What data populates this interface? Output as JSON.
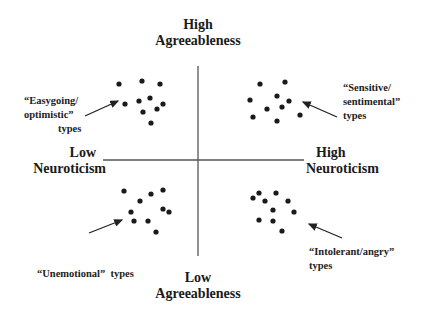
{
  "axes": {
    "top": [
      "High",
      "Agreeableness"
    ],
    "bottom": [
      "Low",
      "Agreeableness"
    ],
    "left": [
      "Low",
      "Neuroticism"
    ],
    "right": [
      "High",
      "Neuroticism"
    ]
  },
  "quadrants": {
    "upper_left": [
      "“Easygoing/",
      "optimistic”",
      "types"
    ],
    "upper_right": [
      "“Sensitive/",
      "sentimental”",
      "types"
    ],
    "lower_left": [
      "“Unemotional”  types"
    ],
    "lower_right": [
      "“Intolerant/angry”",
      "types"
    ]
  },
  "colors": {
    "line": "#555555",
    "dot": "#1a1a1a",
    "arrow": "#222222"
  }
}
